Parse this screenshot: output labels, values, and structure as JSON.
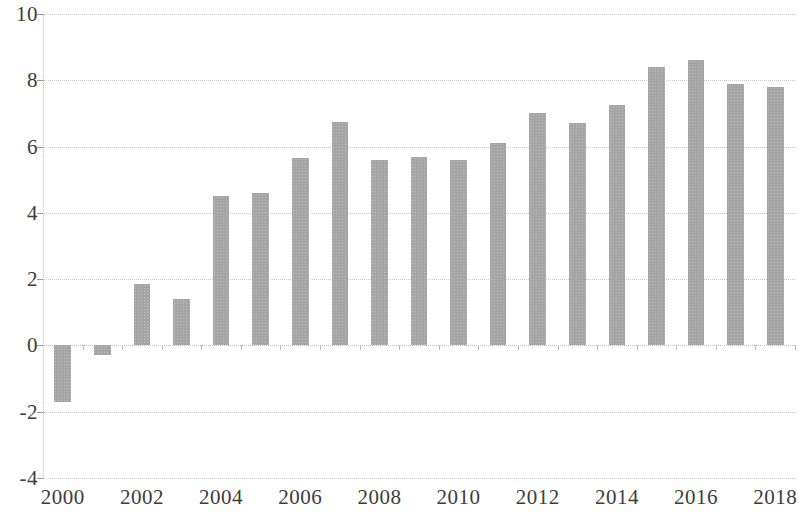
{
  "chart_data": {
    "type": "bar",
    "title": "",
    "subtitle": "",
    "xlabel": "",
    "ylabel": "",
    "grid": true,
    "legend": false,
    "bar_color": "#a5a5a5",
    "categories": [
      "2000",
      "2001",
      "2002",
      "2003",
      "2004",
      "2005",
      "2006",
      "2007",
      "2008",
      "2009",
      "2010",
      "2011",
      "2012",
      "2013",
      "2014",
      "2015",
      "2016",
      "2017",
      "2018"
    ],
    "values": [
      -1.7,
      -0.3,
      1.85,
      1.4,
      4.5,
      4.6,
      5.65,
      6.75,
      5.6,
      5.7,
      5.6,
      6.1,
      7.0,
      6.7,
      7.25,
      8.4,
      8.6,
      7.9,
      7.8
    ],
    "ylim": [
      -4,
      10
    ],
    "ytick_labels": [
      "10",
      "8",
      "6",
      "4",
      "2",
      "0",
      "-2",
      "-4"
    ],
    "ytick_values": [
      10,
      8,
      6,
      4,
      2,
      0,
      -2,
      -4
    ],
    "xtick_labels": [
      "2000",
      "2002",
      "2004",
      "2006",
      "2008",
      "2010",
      "2012",
      "2014",
      "2016",
      "2018"
    ],
    "xtick_categories": [
      "2000",
      "2002",
      "2004",
      "2006",
      "2008",
      "2010",
      "2012",
      "2014",
      "2016",
      "2018"
    ]
  }
}
